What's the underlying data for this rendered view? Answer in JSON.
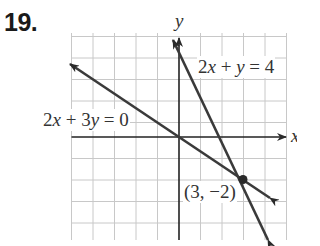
{
  "problem_number": "19.",
  "axes": {
    "x_label": "x",
    "y_label": "y"
  },
  "equations": [
    {
      "label": "2x + y = 4",
      "parts": [
        "2",
        "x",
        " + ",
        "y",
        " = 4"
      ]
    },
    {
      "label": "2x + 3y = 0",
      "parts": [
        "2",
        "x",
        " + 3",
        "y",
        " = 0"
      ]
    }
  ],
  "intersection": {
    "label": "(3, −2)",
    "x": 3,
    "y": -2
  },
  "colors": {
    "grid": "#c8c8c8",
    "axis": "#222222",
    "line": "#3a3a3a",
    "text": "#333333"
  }
}
